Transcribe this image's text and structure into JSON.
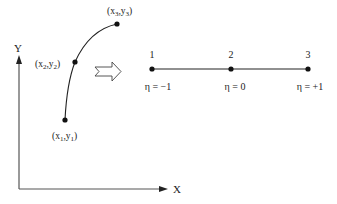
{
  "axes": {
    "x_label": "X",
    "y_label": "Y"
  },
  "curve": {
    "points": [
      {
        "id": "p1",
        "label_x": "x",
        "label_x_sub": "1",
        "label_y": "y",
        "label_y_sub": "1"
      },
      {
        "id": "p2",
        "label_x": "x",
        "label_x_sub": "2",
        "label_y": "y",
        "label_y_sub": "2"
      },
      {
        "id": "p3",
        "label_x": "x",
        "label_x_sub": "3",
        "label_y": "y",
        "label_y_sub": "3"
      }
    ]
  },
  "mapping_arrow": "block-arrow-right",
  "reference_element": {
    "nodes": [
      {
        "number": "1",
        "eta": "η = −1"
      },
      {
        "number": "2",
        "eta": "η = 0"
      },
      {
        "number": "3",
        "eta": "η = +1"
      }
    ]
  },
  "colors": {
    "line": "#222222",
    "axis": "#555555"
  }
}
